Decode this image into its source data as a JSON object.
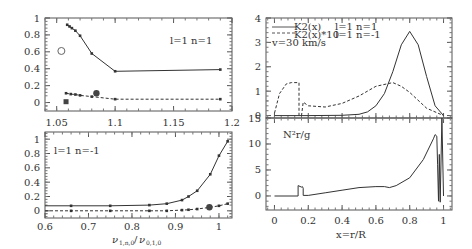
{
  "chart_data": [
    {
      "id": "top-left",
      "type": "scatter",
      "annotation": "l=1 n=1",
      "xlim": [
        1.04,
        1.2
      ],
      "ylim": [
        -0.1,
        1.0
      ],
      "xticks": [
        "1.05",
        "1.1",
        "1.15",
        "1.2"
      ],
      "yticks": [
        "0",
        "0.2",
        "0.4",
        "0.6",
        "0.8",
        "1"
      ],
      "series": [
        {
          "name": "solid",
          "style": "solid",
          "x": [
            1.059,
            1.061,
            1.063,
            1.066,
            1.07,
            1.08,
            1.1,
            1.19
          ],
          "y": [
            0.92,
            0.9,
            0.88,
            0.85,
            0.79,
            0.58,
            0.37,
            0.39
          ]
        },
        {
          "name": "dashed",
          "style": "dashed",
          "x": [
            1.058,
            1.062,
            1.066,
            1.07,
            1.08,
            1.1,
            1.19
          ],
          "y": [
            0.11,
            0.1,
            0.095,
            0.085,
            0.07,
            0.04,
            0.04
          ]
        }
      ],
      "markers": [
        {
          "shape": "open-circle",
          "x": 1.054,
          "y": 0.61
        },
        {
          "shape": "filled-circle",
          "x": 1.084,
          "y": 0.11
        },
        {
          "shape": "filled-square",
          "x": 1.058,
          "y": 0.01
        }
      ]
    },
    {
      "id": "bottom-left",
      "type": "scatter",
      "annotation": "l=1 n=-1",
      "xlabel": "ν_{1,n,0}/ν_{0,1,0}",
      "xlim": [
        0.6,
        1.03
      ],
      "ylim": [
        -0.1,
        1.1
      ],
      "xticks": [
        "0.6",
        "0.7",
        "0.8",
        "0.9",
        "1"
      ],
      "yticks": [
        "0",
        "0.2",
        "0.4",
        "0.6",
        "0.8",
        "1"
      ],
      "series": [
        {
          "name": "solid",
          "style": "solid",
          "x": [
            0.6,
            0.66,
            0.75,
            0.84,
            0.88,
            0.915,
            0.93,
            0.95,
            0.98,
            1.0,
            1.02
          ],
          "y": [
            0.07,
            0.07,
            0.07,
            0.08,
            0.1,
            0.15,
            0.2,
            0.28,
            0.51,
            0.77,
            0.97
          ]
        },
        {
          "name": "dashed",
          "style": "dashed",
          "x": [
            0.6,
            0.66,
            0.75,
            0.84,
            0.88,
            0.915,
            0.93,
            0.95,
            0.98,
            1.0,
            1.02
          ],
          "y": [
            0.0,
            0.0,
            0.0,
            0.0,
            0.0,
            0.01,
            0.015,
            0.025,
            0.05,
            0.07,
            0.1
          ]
        }
      ],
      "markers": [
        {
          "shape": "filled-circle",
          "x": 0.978,
          "y": 0.05
        }
      ]
    },
    {
      "id": "top-right",
      "type": "line",
      "xlim": [
        -0.05,
        1.05
      ],
      "ylim": [
        -0.1,
        4
      ],
      "yticks": [
        "0",
        "1",
        "2",
        "3",
        "4"
      ],
      "legend": [
        {
          "style": "solid",
          "label": "K2(x)",
          "desc": "l=1 n=1"
        },
        {
          "style": "dashed",
          "label": "K2(x)*10",
          "desc": "l=1 n=-1"
        }
      ],
      "annotation": "v=30 km/s",
      "series": [
        {
          "name": "K2(x) l=1 n=1",
          "style": "solid",
          "x": [
            0,
            0.2,
            0.4,
            0.5,
            0.55,
            0.6,
            0.65,
            0.7,
            0.75,
            0.8,
            0.85,
            0.9,
            0.95,
            1.0
          ],
          "y": [
            0,
            0,
            0.01,
            0.05,
            0.15,
            0.4,
            0.9,
            1.8,
            2.9,
            3.45,
            2.9,
            1.6,
            0.4,
            0
          ]
        },
        {
          "name": "K2(x)*10 l=1 n=-1",
          "style": "dashed",
          "x": [
            0.0,
            0.03,
            0.07,
            0.1,
            0.145,
            0.145,
            0.16,
            0.17,
            0.2,
            0.3,
            0.4,
            0.5,
            0.6,
            0.7,
            0.75,
            0.8,
            0.9,
            1.0
          ],
          "y": [
            0.1,
            0.9,
            1.3,
            1.35,
            1.35,
            0.0,
            0.0,
            0.55,
            0.4,
            0.35,
            0.5,
            0.8,
            1.2,
            1.35,
            1.2,
            0.95,
            0.3,
            0.0
          ]
        }
      ]
    },
    {
      "id": "bottom-right",
      "type": "line",
      "annotation": "N²r/g",
      "xlabel": "x=r/R",
      "xlim": [
        -0.05,
        1.05
      ],
      "ylim": [
        -2.7,
        15
      ],
      "xticks": [
        "0",
        "0.2",
        "0.4",
        "0.6",
        "0.8",
        "1"
      ],
      "yticks": [
        "0",
        "5",
        "10",
        "15"
      ],
      "series": [
        {
          "name": "N2r/g",
          "style": "solid",
          "x": [
            0.0,
            0.14,
            0.14,
            0.16,
            0.165,
            0.17,
            0.17,
            0.2,
            0.3,
            0.4,
            0.5,
            0.6,
            0.65,
            0.68,
            0.72,
            0.8,
            0.88,
            0.94,
            0.95,
            0.96,
            0.965,
            0.97,
            0.975,
            0.98,
            0.99,
            1.0
          ],
          "y": [
            0,
            0,
            2,
            1.7,
            1.8,
            1.5,
            0.1,
            0.1,
            0.6,
            1.1,
            1.6,
            1.8,
            1.8,
            1.6,
            2.0,
            3.5,
            7.0,
            11.0,
            11.8,
            11.5,
            6.0,
            -1.0,
            8.0,
            -1.2,
            15.0,
            0.0
          ]
        }
      ]
    }
  ],
  "labels": {
    "tl_annotation": "l=1  n=1",
    "bl_annotation": "l=1  n=-1",
    "tr_legend1_label": "K2(x)",
    "tr_legend1_desc": "l=1  n=1",
    "tr_legend2_label": "K2(x)*10",
    "tr_legend2_desc": "l=1  n=-1",
    "tr_velocity": "v=30 km/s",
    "br_annotation": "N²r/g",
    "bl_xlabel_nu1": "ν",
    "bl_xlabel_sub1": "1,n,0",
    "bl_xlabel_sep": "/",
    "bl_xlabel_nu2": "ν",
    "bl_xlabel_sub2": "0,1,0",
    "br_xlabel": "x=r/R"
  },
  "colors": {
    "line": "#333333",
    "frame": "#555555",
    "text": "#333333"
  }
}
